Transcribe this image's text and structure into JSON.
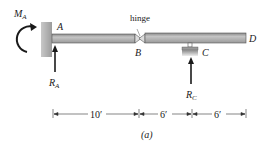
{
  "figure": {
    "caption": "(a)",
    "points": {
      "A": "A",
      "B": "B",
      "C": "C",
      "D": "D"
    },
    "hinge_label": "hinge",
    "moment_label": "M",
    "moment_sub": "A",
    "reaction_A": "R",
    "reaction_A_sub": "A",
    "reaction_C": "R",
    "reaction_C_sub": "C",
    "dimensions": [
      "10′",
      "6′",
      "6′"
    ],
    "colors": {
      "beam": "#a9a9a9",
      "beam_edge": "#555555",
      "wall": "#b8b8b8",
      "ink": "#1a1a1a"
    }
  }
}
